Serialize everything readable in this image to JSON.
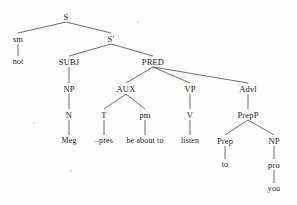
{
  "diagram": {
    "type": "syntax-tree",
    "sentence": "not Meg -pres be about to listen to you",
    "line_color": "#4a4a4a",
    "text_color": "#1a1a1a",
    "background": "#fefefe",
    "width": 297,
    "height": 205,
    "nodes": [
      {
        "id": "S",
        "label": "S",
        "x": 66,
        "y": 17,
        "kind": "nonterminal"
      },
      {
        "id": "sm",
        "label": "sm",
        "x": 18,
        "y": 39,
        "kind": "nonterminal"
      },
      {
        "id": "not",
        "label": "not",
        "x": 18,
        "y": 62,
        "kind": "terminal"
      },
      {
        "id": "Sprime",
        "label": "S′",
        "x": 111,
        "y": 39,
        "kind": "nonterminal"
      },
      {
        "id": "SUBJ",
        "label": "SUBJ",
        "x": 69,
        "y": 62,
        "kind": "nonterminal"
      },
      {
        "id": "NP1",
        "label": "NP",
        "x": 69,
        "y": 89,
        "kind": "nonterminal"
      },
      {
        "id": "N",
        "label": "N",
        "x": 69,
        "y": 115,
        "kind": "nonterminal"
      },
      {
        "id": "Meg",
        "label": "Meg",
        "x": 69,
        "y": 141,
        "kind": "terminal"
      },
      {
        "id": "PRED",
        "label": "PRED",
        "x": 153,
        "y": 62,
        "kind": "nonterminal"
      },
      {
        "id": "AUX",
        "label": "AUX",
        "x": 126,
        "y": 89,
        "kind": "nonterminal"
      },
      {
        "id": "T",
        "label": "T",
        "x": 104,
        "y": 115,
        "kind": "nonterminal"
      },
      {
        "id": "pres",
        "label": "–pres",
        "x": 104,
        "y": 141,
        "kind": "terminal"
      },
      {
        "id": "pm",
        "label": "pm",
        "x": 145,
        "y": 115,
        "kind": "nonterminal"
      },
      {
        "id": "beaboutto",
        "label": "be about to",
        "x": 145,
        "y": 141,
        "kind": "terminal"
      },
      {
        "id": "VP",
        "label": "VP",
        "x": 190,
        "y": 89,
        "kind": "nonterminal"
      },
      {
        "id": "V",
        "label": "V",
        "x": 190,
        "y": 115,
        "kind": "nonterminal"
      },
      {
        "id": "listen",
        "label": "listen",
        "x": 190,
        "y": 141,
        "kind": "terminal"
      },
      {
        "id": "Advl",
        "label": "Advl",
        "x": 248,
        "y": 89,
        "kind": "nonterminal"
      },
      {
        "id": "PrepP",
        "label": "PrepP",
        "x": 248,
        "y": 115,
        "kind": "nonterminal"
      },
      {
        "id": "Prep",
        "label": "Prep",
        "x": 225,
        "y": 141,
        "kind": "nonterminal"
      },
      {
        "id": "to",
        "label": "to",
        "x": 225,
        "y": 165,
        "kind": "terminal"
      },
      {
        "id": "NP2",
        "label": "NP",
        "x": 274,
        "y": 141,
        "kind": "nonterminal"
      },
      {
        "id": "pro",
        "label": "pro",
        "x": 274,
        "y": 165,
        "kind": "nonterminal"
      },
      {
        "id": "you",
        "label": "you",
        "x": 274,
        "y": 189,
        "kind": "terminal"
      }
    ],
    "edges": [
      {
        "from": "S",
        "to": "sm"
      },
      {
        "from": "S",
        "to": "Sprime"
      },
      {
        "from": "sm",
        "to": "not"
      },
      {
        "from": "Sprime",
        "to": "SUBJ"
      },
      {
        "from": "Sprime",
        "to": "PRED"
      },
      {
        "from": "SUBJ",
        "to": "NP1"
      },
      {
        "from": "NP1",
        "to": "N"
      },
      {
        "from": "N",
        "to": "Meg"
      },
      {
        "from": "PRED",
        "to": "AUX"
      },
      {
        "from": "PRED",
        "to": "VP"
      },
      {
        "from": "PRED",
        "to": "Advl"
      },
      {
        "from": "AUX",
        "to": "T"
      },
      {
        "from": "AUX",
        "to": "pm"
      },
      {
        "from": "T",
        "to": "pres"
      },
      {
        "from": "pm",
        "to": "beaboutto"
      },
      {
        "from": "VP",
        "to": "V"
      },
      {
        "from": "V",
        "to": "listen"
      },
      {
        "from": "Advl",
        "to": "PrepP"
      },
      {
        "from": "PrepP",
        "to": "Prep"
      },
      {
        "from": "PrepP",
        "to": "NP2"
      },
      {
        "from": "Prep",
        "to": "to"
      },
      {
        "from": "NP2",
        "to": "pro"
      },
      {
        "from": "pro",
        "to": "you"
      }
    ],
    "specks": [
      {
        "x": 137,
        "y": 21
      },
      {
        "x": 33,
        "y": 122
      },
      {
        "x": 70,
        "y": 170
      }
    ]
  }
}
